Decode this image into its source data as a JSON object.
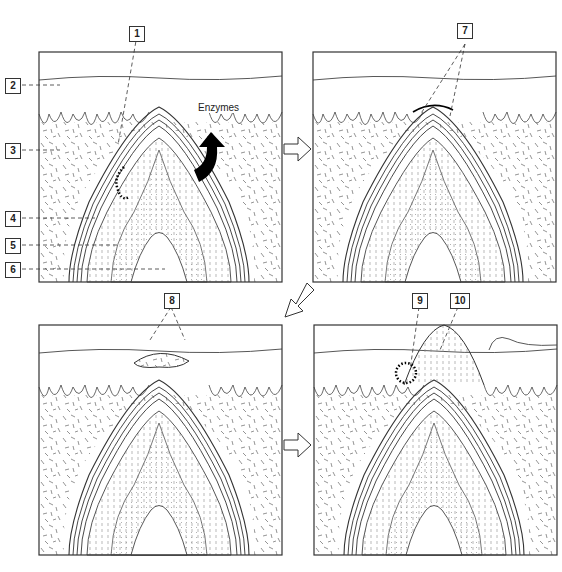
{
  "labels": {
    "l1": "1",
    "l2": "2",
    "l3": "3",
    "l4": "4",
    "l5": "5",
    "l6": "6",
    "l7": "7",
    "l8": "8",
    "l9": "9",
    "l10": "10"
  },
  "annotations": {
    "enzymes": "Enzymes"
  },
  "panels": [
    {
      "id": "panel-1",
      "stage": "tooth crown beneath oral epithelium, enzymes released"
    },
    {
      "id": "panel-2",
      "stage": "reduced enamel epithelium fuses with oral epithelium"
    },
    {
      "id": "panel-3",
      "stage": "degeneration of fused epithelium over cusp"
    },
    {
      "id": "panel-4",
      "stage": "tooth emerges through epithelium"
    }
  ],
  "colors": {
    "line": "#333333",
    "texture": "#555555",
    "background": "#ffffff"
  }
}
